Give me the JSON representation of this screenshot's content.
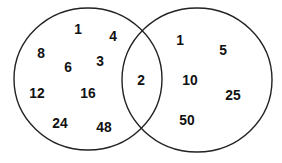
{
  "diagram": {
    "type": "venn",
    "stroke_color": "#222222",
    "text_color": "#111111",
    "sets": [
      {
        "name": "left-set",
        "ellipse": {
          "cx": 88,
          "cy": 79,
          "rx": 74,
          "ry": 71
        },
        "only_values": [
          {
            "value": "1",
            "x": 78,
            "y": 28
          },
          {
            "value": "4",
            "x": 113,
            "y": 35
          },
          {
            "value": "8",
            "x": 41,
            "y": 52
          },
          {
            "value": "6",
            "x": 68,
            "y": 66
          },
          {
            "value": "3",
            "x": 100,
            "y": 60
          },
          {
            "value": "12",
            "x": 37,
            "y": 92
          },
          {
            "value": "16",
            "x": 88,
            "y": 92
          },
          {
            "value": "24",
            "x": 60,
            "y": 122
          },
          {
            "value": "48",
            "x": 104,
            "y": 126
          }
        ]
      },
      {
        "name": "right-set",
        "ellipse": {
          "cx": 197,
          "cy": 80,
          "rx": 75,
          "ry": 72
        },
        "only_values": [
          {
            "value": "1",
            "x": 180,
            "y": 39
          },
          {
            "value": "5",
            "x": 223,
            "y": 49
          },
          {
            "value": "10",
            "x": 190,
            "y": 79
          },
          {
            "value": "25",
            "x": 233,
            "y": 94
          },
          {
            "value": "50",
            "x": 187,
            "y": 119
          }
        ]
      }
    ],
    "intersection_values": [
      {
        "value": "2",
        "x": 141,
        "y": 79
      }
    ]
  }
}
